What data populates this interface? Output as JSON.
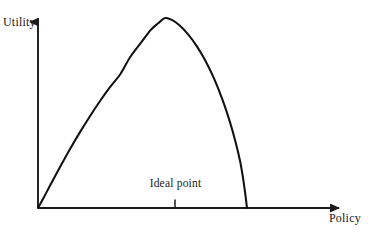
{
  "chart_data": {
    "type": "line",
    "title": "",
    "subtitle": "",
    "xlabel": "Policy",
    "ylabel": "Utility",
    "grid": false,
    "legend": null,
    "axis_style": "arrow-headed half-axes, no tick labels, no numeric scale",
    "xlim": [
      0,
      1
    ],
    "ylim": [
      0,
      1
    ],
    "annotations": [
      {
        "text": "Ideal point",
        "x": 0.441,
        "y": 0,
        "marker": "vertical tick on x-axis",
        "position": "above axis, centered on peak"
      }
    ],
    "series": [
      {
        "name": "Utility curve",
        "description": "Asymmetric single-peaked utility function: rises nearly linearly from the origin to a maximum at the ideal point, then falls off steeply to zero.",
        "color": "#111111",
        "x": [
          0.0,
          0.02,
          0.045,
          0.075,
          0.11,
          0.145,
          0.18,
          0.215,
          0.25,
          0.285,
          0.32,
          0.355,
          0.39,
          0.415,
          0.441,
          0.465,
          0.49,
          0.52,
          0.55,
          0.58,
          0.61,
          0.64,
          0.665,
          0.685,
          0.7,
          0.71,
          0.718,
          0.724
        ],
        "y": [
          0.0,
          0.055,
          0.128,
          0.212,
          0.308,
          0.398,
          0.483,
          0.563,
          0.637,
          0.704,
          0.796,
          0.866,
          0.936,
          0.971,
          1.0,
          0.989,
          0.962,
          0.914,
          0.852,
          0.775,
          0.681,
          0.566,
          0.452,
          0.344,
          0.247,
          0.16,
          0.075,
          0.0
        ]
      }
    ]
  },
  "geometry": {
    "origin_x": 38,
    "origin_y": 208,
    "y_axis_top": 14,
    "x_axis_right": 348,
    "peak_x": 174,
    "peak_y": 18,
    "zero_crossing_x": 247,
    "tick_x": 175,
    "tick_top": 199,
    "tick_bottom": 208
  },
  "colors": {
    "background": "#ffffff",
    "axis": "#1a1a1a",
    "curve": "#111111",
    "text": "#1a1a1a"
  }
}
